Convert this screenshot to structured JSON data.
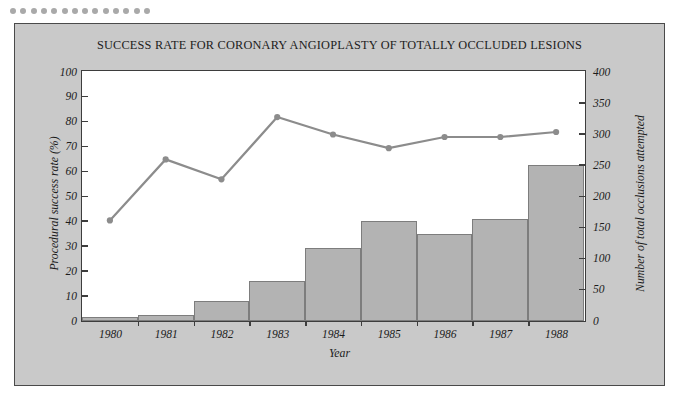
{
  "decor": {
    "dot_count": 14,
    "dot_color": "#a9a9a9"
  },
  "panel": {
    "background": "#c9c9c9",
    "border_color": "#4a4a4a",
    "plot_background": "#ffffff"
  },
  "chart_data": {
    "type": "bar",
    "title": "SUCCESS RATE FOR CORONARY ANGIOPLASTY OF TOTALLY OCCLUDED LESIONS",
    "xlabel": "Year",
    "categories": [
      "1980",
      "1981",
      "1982",
      "1983",
      "1984",
      "1985",
      "1986",
      "1987",
      "1988"
    ],
    "grid": false,
    "legend": "none",
    "axes": {
      "left": {
        "label": "Procedural success rate (%)",
        "ylim": [
          0,
          100
        ],
        "ticks": [
          0,
          10,
          20,
          30,
          40,
          50,
          60,
          70,
          80,
          90,
          100
        ],
        "tick_labels": [
          "0",
          "10",
          "20",
          "30",
          "40",
          "50",
          "60",
          "70",
          "80",
          "90",
          "100"
        ]
      },
      "right": {
        "label": "Number of total occlusions attempted",
        "ylim": [
          0,
          400
        ],
        "ticks": [
          0,
          50,
          100,
          150,
          200,
          250,
          300,
          350,
          400
        ],
        "tick_labels": [
          "0",
          "50",
          "100",
          "150",
          "200",
          "250",
          "300",
          "350",
          "400"
        ]
      }
    },
    "series": [
      {
        "name": "Number of total occlusions attempted",
        "type": "bar",
        "axis": "right",
        "color": "#b3b3b3",
        "edge_color": "#7d7d7d",
        "values": [
          6,
          10,
          32,
          64,
          118,
          160,
          140,
          164,
          250
        ]
      },
      {
        "name": "Procedural success rate (%)",
        "type": "line",
        "axis": "left",
        "color": "#8c8c8c",
        "marker": "circle",
        "values": [
          40,
          64.5,
          56.5,
          81.5,
          74.5,
          69,
          73.5,
          73.5,
          75.5
        ]
      }
    ]
  }
}
